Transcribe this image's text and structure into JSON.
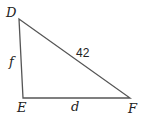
{
  "diagram": {
    "type": "triangle",
    "vertices": {
      "D": {
        "label": "D"
      },
      "E": {
        "label": "E"
      },
      "F": {
        "label": "F"
      }
    },
    "sides": {
      "DF": {
        "label": "42"
      },
      "DE": {
        "label": "f"
      },
      "EF": {
        "label": "d"
      }
    },
    "right_angle_at": "E"
  }
}
